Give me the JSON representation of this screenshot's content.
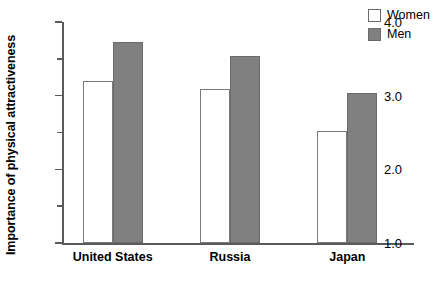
{
  "chart_data": {
    "type": "bar",
    "title": "",
    "xlabel": "",
    "ylabel": "Importance of physical attractiveness",
    "categories": [
      "United States",
      "Russia",
      "Japan"
    ],
    "series": [
      {
        "name": "Women",
        "values": [
          3.2,
          3.09,
          2.52
        ],
        "color": "#ffffff"
      },
      {
        "name": "Men",
        "values": [
          3.73,
          3.54,
          3.03
        ],
        "color": "#808080"
      }
    ],
    "ylim": [
      1.0,
      4.0
    ],
    "ytick_labels": [
      "1.0",
      "2.0",
      "3.0",
      "4.0"
    ],
    "ytick_values": [
      1.0,
      2.0,
      3.0,
      4.0
    ],
    "yminor_values": [
      1.5,
      2.5,
      3.5
    ],
    "grid": false,
    "legend_position": "top-right"
  },
  "legend": {
    "entries": [
      {
        "label": "Women"
      },
      {
        "label": "Men"
      }
    ]
  }
}
